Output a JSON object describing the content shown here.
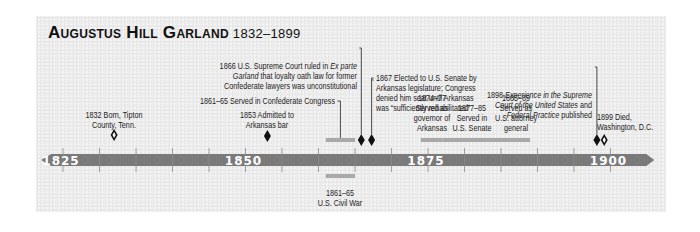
{
  "title": {
    "name": "Augustus Hill Garland",
    "years": "1832–1899"
  },
  "colors": {
    "axis": "#7a7a7a",
    "span_bar": "#a9a9a9",
    "marker": "#111111",
    "background": "#ebebeb"
  },
  "chart_data": {
    "type": "timeline",
    "axis": {
      "range": [
        1822,
        1906
      ],
      "tick_interval": 5,
      "labels": [
        "1825",
        "1850",
        "1875",
        "1900"
      ]
    },
    "point_events": [
      {
        "year": 1832,
        "marker": "open-diamond-icon",
        "text": [
          "1832 Born, Tipton",
          "County, Tenn."
        ]
      },
      {
        "year": 1853,
        "marker": "solid-diamond-icon",
        "text": [
          "1853 Admitted to",
          "Arkansas bar"
        ]
      },
      {
        "year": 1866,
        "marker": "solid-diamond-icon",
        "text": [
          "1866 U.S. Supreme Court ruled in Ex parte",
          "Garland that loyalty oath law for former",
          "Confederate lawyers was unconstitutional"
        ]
      },
      {
        "year": 1867,
        "marker": "solid-diamond-icon",
        "text": [
          "1867 Elected to U.S. Senate by",
          "Arkansas legislature; Congress",
          "denied him seat until Arkansas",
          "was “sufficiently rehabilitated”"
        ]
      },
      {
        "year": 1898,
        "marker": "solid-diamond-icon",
        "text": [
          "1898 Experience in the Supreme",
          "Court of the United States and",
          "Federal Practice published"
        ]
      },
      {
        "year": 1899,
        "marker": "open-diamond-icon",
        "text": [
          "1899 Died,",
          "Washington, D.C."
        ]
      }
    ],
    "span_events": [
      {
        "start": 1861,
        "end": 1865,
        "position": "above",
        "text": [
          "1861–65 Served in Confederate Congress"
        ]
      },
      {
        "start": 1874,
        "end": 1877,
        "position": "above",
        "text": [
          "1874–77",
          "Served as",
          "governor of",
          "Arkansas"
        ]
      },
      {
        "start": 1877,
        "end": 1885,
        "position": "above",
        "text": [
          "1877–85",
          "Served in",
          "U.S. Senate"
        ]
      },
      {
        "start": 1885,
        "end": 1889,
        "position": "above",
        "text": [
          "1885–89",
          "Served as",
          "U.S. attorney",
          "general"
        ]
      },
      {
        "start": 1861,
        "end": 1865,
        "position": "below",
        "text": [
          "1861–65",
          "U.S. Civil War"
        ]
      }
    ]
  }
}
